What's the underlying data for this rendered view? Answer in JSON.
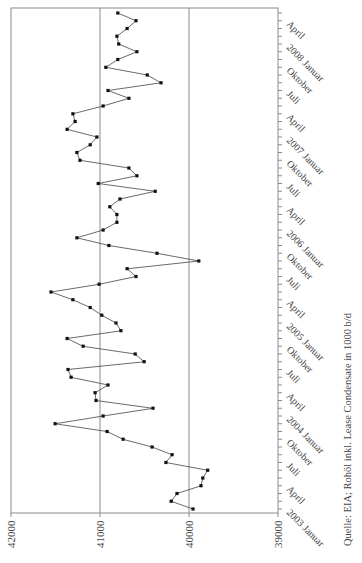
{
  "chart_data": {
    "type": "line",
    "title": "",
    "xlabel": "",
    "ylabel": "",
    "orientation": "rotated 90° (time axis vertical, bottom-to-top; value axis horizontal, decreasing to the right)",
    "ylim": [
      39000,
      42000
    ],
    "yticks": [
      42000,
      41000,
      40000,
      39000
    ],
    "grid": "major value gridlines",
    "legend": "none",
    "caption": "Quelle: EIA; Rohöl inkl. Lease Condensate in 1000 b/d",
    "x_start": "2003 Januar",
    "x_end": "2008 Mai",
    "x_tick_labels": [
      "2003 Januar",
      "April",
      "Juli",
      "Oktober",
      "2004 Januar",
      "April",
      "Juli",
      "Oktober",
      "2005 Januar",
      "April",
      "Juli",
      "Oktober",
      "2006 Januar",
      "April",
      "Juli",
      "Oktober",
      "2007 Januar",
      "April",
      "Juli",
      "Oktober",
      "2008 Januar",
      "April"
    ],
    "series": [
      {
        "name": "Rohöl inkl. Lease Condensate (1000 b/d)",
        "values": [
          39955,
          40200,
          40135,
          39865,
          39845,
          39790,
          40260,
          40190,
          40415,
          40740,
          40920,
          41505,
          40965,
          40405,
          41045,
          41055,
          40910,
          41325,
          41360,
          40505,
          40605,
          41190,
          41370,
          40765,
          40820,
          40980,
          41110,
          41305,
          41550,
          41010,
          40595,
          40695,
          39890,
          40360,
          40900,
          41260,
          40965,
          40810,
          40810,
          40890,
          40775,
          40380,
          41020,
          40585,
          40675,
          41225,
          41260,
          41110,
          41035,
          41370,
          41280,
          41305,
          40965,
          40675,
          40910,
          40315,
          40470,
          40935,
          40800,
          40585,
          40790,
          40810,
          40695,
          40595,
          40800
        ]
      }
    ]
  },
  "axis": {
    "value_labels": [
      "42000",
      "41000",
      "40000",
      "39000"
    ]
  },
  "caption": "Quelle: EIA; Rohöl inkl. Lease Condensate in 1000 b/d"
}
